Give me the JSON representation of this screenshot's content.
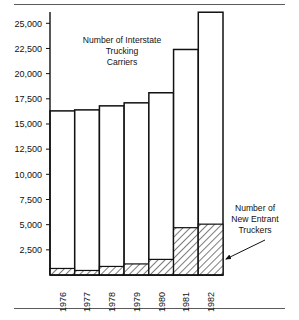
{
  "figure": {
    "top_rule": true,
    "bottom_rule": true
  },
  "annotations": {
    "series_total_label_lines": [
      "Number of Interstate",
      "Trucking",
      "Carriers"
    ],
    "series_total_label": "Number of Interstate Trucking Carriers",
    "series_sub_label_lines": [
      "Number of",
      "New Entrant",
      "Truckers"
    ],
    "series_sub_label": "Number of New Entrant Truckers"
  },
  "chart_data": {
    "type": "bar",
    "title": "Number of Interstate Trucking Carriers",
    "xlabel": "",
    "ylabel": "",
    "categories": [
      "1976",
      "1977",
      "1978",
      "1979",
      "1980",
      "1981",
      "1982"
    ],
    "series": [
      {
        "name": "Number of New Entrant Truckers",
        "values": [
          650,
          450,
          850,
          1100,
          1550,
          4700,
          5050
        ],
        "fill": "hatched"
      },
      {
        "name": "Number of Interstate Trucking Carriers",
        "values": [
          16300,
          16400,
          16800,
          17100,
          18100,
          22400,
          26100
        ],
        "fill": "white"
      }
    ],
    "stacked": true,
    "ylim": [
      0,
      26500
    ],
    "yticks": [
      2500,
      5000,
      7500,
      10000,
      12500,
      15000,
      17500,
      20000,
      22500,
      25000
    ],
    "ytick_labels": [
      "2,500",
      "5,000",
      "7,500",
      "10,000",
      "12,500",
      "15,000",
      "17,500",
      "20,000",
      "22,500",
      "25,000"
    ],
    "grid": false,
    "legend": "none",
    "xtick_rotation": 90,
    "colors": {
      "outline": "#111111",
      "bar_fill": "#ffffff",
      "hatch": "#111111",
      "background": "#ffffff"
    }
  }
}
